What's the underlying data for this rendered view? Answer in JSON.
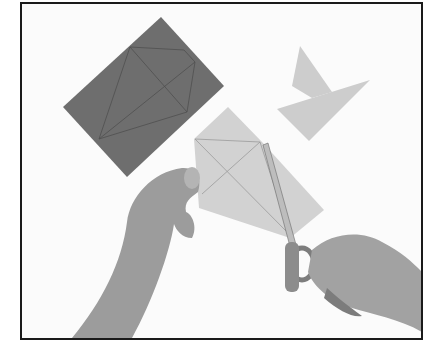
{
  "image": {
    "description": "Black-and-white instructional photo: hands cutting a light gray paper kite shape with scissors; a dark gray rectangle with pencil-drawn lines and two light gray cut triangular pieces lie on a white surface",
    "style": "grayscale photograph with black border frame"
  },
  "colors": {
    "background": "#fbfbfb",
    "border": "#1a1a1a",
    "dark_paper": "#6f6f6f",
    "light_paper": "#cfcfcf",
    "skin": "#9a9a9a"
  }
}
